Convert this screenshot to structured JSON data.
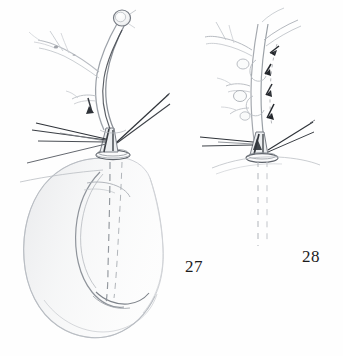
{
  "plate": {
    "kind": "scientific-line-drawing",
    "background_color": "#fefefe",
    "ink_color": "#2b2b2b",
    "faint_ink_color": "#b9bcc2",
    "width": 343,
    "height": 356,
    "figures": [
      {
        "id": "figure-27",
        "label": "27",
        "label_x": 185,
        "label_y": 258,
        "description": "Whole organ in lateral view: branched duct system above, basal collar ring, large C-shaped body below",
        "parts": [
          {
            "name": "terminal-bulb",
            "note": "small rounded knob at apex of main duct"
          },
          {
            "name": "main-duct",
            "note": "long curved tube descending from bulb to base"
          },
          {
            "name": "lateral-branch-upper-left",
            "note": "faint branching tubules"
          },
          {
            "name": "lateral-branch-mid-left",
            "note": "short branch with dark arrowhead mark"
          },
          {
            "name": "setae-fan-left",
            "note": "four long thin bristles radiating to the left"
          },
          {
            "name": "seta-pair-right",
            "note": "narrow elongated V of two bristles to upper right"
          },
          {
            "name": "collar-ring",
            "note": "elliptical annulus at the base of the duct"
          },
          {
            "name": "body-outline",
            "note": "large C / kidney shaped reniform body"
          },
          {
            "name": "inner-lobe",
            "note": "inner curved lobe inside the C"
          },
          {
            "name": "internal-duct-dashed",
            "note": "two dashed lines tracing duct inside body"
          }
        ]
      },
      {
        "id": "figure-28",
        "label": "28",
        "label_x": 302,
        "label_y": 248,
        "description": "Detail of duct base and branches with flow arrows; body omitted, duct shown dashed below",
        "parts": [
          {
            "name": "main-duct",
            "note": "curved tube with swellings"
          },
          {
            "name": "lateral-branches-left",
            "note": "three branching tubules with nodules"
          },
          {
            "name": "branch-upper-right",
            "note": "tube ascending to upper right"
          },
          {
            "name": "flow-arrows",
            "count": 4,
            "note": "small dark arrowheads along the duct pointing downward"
          },
          {
            "name": "setae-fan-left",
            "note": "two long thin bristles to the left"
          },
          {
            "name": "seta-pair-right",
            "note": "narrow V of bristles to the right"
          },
          {
            "name": "collar-ring",
            "note": "elliptical annulus at the base"
          },
          {
            "name": "duct-continuation-dashed",
            "note": "two faded dashed lines descending"
          }
        ]
      }
    ]
  }
}
